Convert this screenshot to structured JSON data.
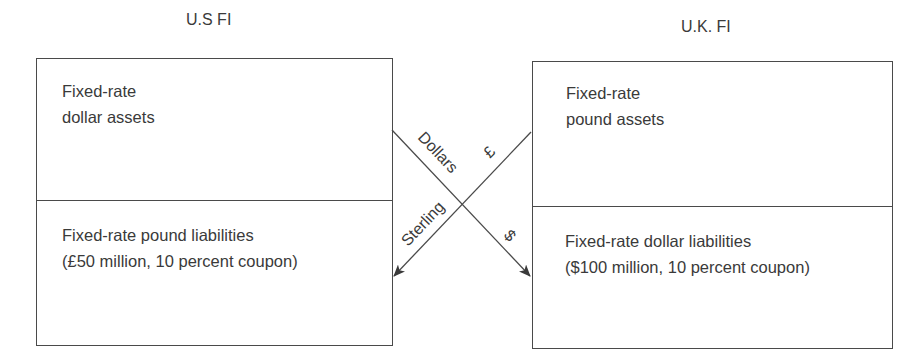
{
  "diagram": {
    "left_entity": {
      "title": "U.S FI",
      "assets": {
        "line1": "Fixed-rate",
        "line2": "dollar assets"
      },
      "liabilities": {
        "line1": "Fixed-rate pound liabilities",
        "line2": "(£50 million, 10 percent coupon)"
      }
    },
    "right_entity": {
      "title": "U.K. FI",
      "assets": {
        "line1": "Fixed-rate",
        "line2": "pound assets"
      },
      "liabilities": {
        "line1": "Fixed-rate dollar liabilities",
        "line2": "($100 million, 10 percent coupon)"
      }
    },
    "flows": {
      "dollar_flow": {
        "label_upper": "Dollars",
        "label_lower": "$"
      },
      "sterling_flow": {
        "label_upper": "£",
        "label_lower": "Sterling"
      }
    },
    "colors": {
      "line": "#4a4a4a",
      "text": "#3a3a3a",
      "background": "#ffffff"
    }
  }
}
